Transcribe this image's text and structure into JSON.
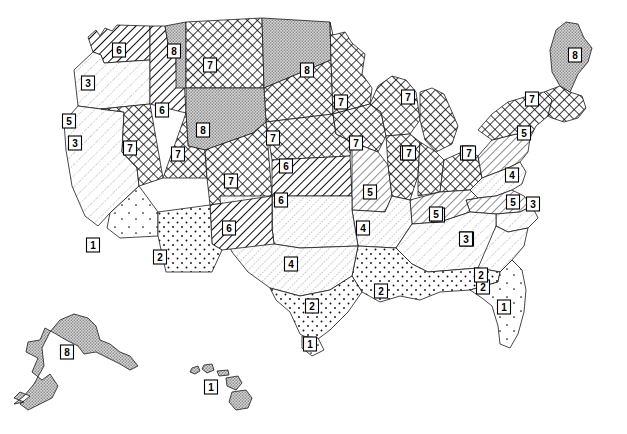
{
  "map": {
    "title": "United States Hardiness Zone Map",
    "projection_note": "Contiguous United States with Alaska and Hawaii insets",
    "width": 627,
    "height": 434,
    "background_color": "#ffffff",
    "outline_color": "#000000",
    "label_box_fill": "#ffffff"
  },
  "legend_patterns": [
    {
      "zone": "1",
      "name": "sparse-dots",
      "fill_color": "#ffffff",
      "description": "very sparse stipple"
    },
    {
      "zone": "2",
      "name": "dots",
      "fill_color": "#ffffff",
      "description": "open dot stipple"
    },
    {
      "zone": "3",
      "name": "fine-diagonal",
      "fill_color": "#ffffff",
      "description": "fine diagonal hatch, low density"
    },
    {
      "zone": "4",
      "name": "diagonal-light",
      "fill_color": "#ffffff",
      "description": "light diagonal hatch"
    },
    {
      "zone": "5",
      "name": "diagonal-medium",
      "fill_color": "#ffffff",
      "description": "medium diagonal hatch"
    },
    {
      "zone": "6",
      "name": "diagonal-bold",
      "fill_color": "#ffffff",
      "description": "bold diagonal hatch"
    },
    {
      "zone": "7",
      "name": "crosshatch",
      "fill_color": "#ffffff",
      "description": "dense cross hatch"
    },
    {
      "zone": "8",
      "name": "stipple-dense",
      "fill_color": "#d8d8d8",
      "description": "dense gray stipple / fine crosshatch"
    }
  ],
  "chart_data": {
    "type": "map",
    "value_field": "zone",
    "zone_range": [
      1,
      8
    ],
    "regions": [
      {
        "id": "washington",
        "name": "Washington",
        "zone": "6",
        "label_x": 119,
        "label_y": 50
      },
      {
        "id": "oregon",
        "name": "Oregon",
        "zone": "3",
        "label_x": 88,
        "label_y": 83
      },
      {
        "id": "n-california",
        "name": "Northern California",
        "zone": "5",
        "label_x": 69,
        "label_y": 121
      },
      {
        "id": "california",
        "name": "California",
        "zone": "3",
        "label_x": 75,
        "label_y": 143
      },
      {
        "id": "s-california",
        "name": "Southern California",
        "zone": "1",
        "label_x": 93,
        "label_y": 245
      },
      {
        "id": "idaho",
        "name": "Idaho",
        "zone": "6",
        "label_x": 162,
        "label_y": 110
      },
      {
        "id": "w-montana",
        "name": "Western Montana",
        "zone": "8",
        "label_x": 174,
        "label_y": 51
      },
      {
        "id": "e-montana",
        "name": "Eastern Montana",
        "zone": "7",
        "label_x": 210,
        "label_y": 65
      },
      {
        "id": "north-dakota",
        "name": "North Dakota",
        "zone": "8",
        "label_x": 307,
        "label_y": 70
      },
      {
        "id": "minnesota",
        "name": "Minnesota",
        "zone": "7",
        "label_x": 341,
        "label_y": 102
      },
      {
        "id": "wyoming",
        "name": "Wyoming",
        "zone": "8",
        "label_x": 203,
        "label_y": 130
      },
      {
        "id": "south-dakota",
        "name": "South Dakota",
        "zone": "7",
        "label_x": 273,
        "label_y": 138
      },
      {
        "id": "nevada",
        "name": "Nevada",
        "zone": "7",
        "label_x": 130,
        "label_y": 148
      },
      {
        "id": "utah",
        "name": "Utah",
        "zone": "7",
        "label_x": 178,
        "label_y": 154
      },
      {
        "id": "colorado",
        "name": "Colorado",
        "zone": "7",
        "label_x": 231,
        "label_y": 181
      },
      {
        "id": "nebraska",
        "name": "Nebraska",
        "zone": "6",
        "label_x": 286,
        "label_y": 166
      },
      {
        "id": "iowa",
        "name": "Iowa",
        "zone": "7",
        "label_x": 356,
        "label_y": 143
      },
      {
        "id": "kansas",
        "name": "Kansas",
        "zone": "6",
        "label_x": 281,
        "label_y": 200
      },
      {
        "id": "missouri",
        "name": "Missouri",
        "zone": "5",
        "label_x": 370,
        "label_y": 192
      },
      {
        "id": "wisconsin",
        "name": "Wisconsin",
        "zone": "7",
        "label_x": 408,
        "label_y": 97
      },
      {
        "id": "michigan",
        "name": "Michigan",
        "zone": "7",
        "label_x": 407,
        "label_y": 153
      },
      {
        "id": "illinois",
        "name": "Illinois",
        "zone": "7",
        "label_x": 409,
        "label_y": 153
      },
      {
        "id": "indiana",
        "name": "Indiana",
        "zone": "7",
        "label_x": 467,
        "label_y": 153
      },
      {
        "id": "arizona",
        "name": "Arizona",
        "zone": "2",
        "label_x": 160,
        "label_y": 257
      },
      {
        "id": "new-mexico",
        "name": "New Mexico",
        "zone": "6",
        "label_x": 229,
        "label_y": 228
      },
      {
        "id": "oklahoma",
        "name": "Oklahoma",
        "zone": "4",
        "label_x": 363,
        "label_y": 228
      },
      {
        "id": "texas",
        "name": "Texas",
        "zone": "4",
        "label_x": 291,
        "label_y": 264
      },
      {
        "id": "s-texas",
        "name": "South Texas",
        "zone": "2",
        "label_x": 312,
        "label_y": 306
      },
      {
        "id": "texas-tip",
        "name": "Texas Gulf Tip",
        "zone": "1",
        "label_x": 310,
        "label_y": 344
      },
      {
        "id": "louisiana",
        "name": "Louisiana",
        "zone": "2",
        "label_x": 381,
        "label_y": 291
      },
      {
        "id": "arkansas",
        "name": "Arkansas",
        "zone": "4",
        "label_x": 363,
        "label_y": 228
      },
      {
        "id": "tennessee",
        "name": "Tennessee",
        "zone": "5",
        "label_x": 438,
        "label_y": 215
      },
      {
        "id": "kentucky",
        "name": "Kentucky",
        "zone": "5",
        "label_x": 436,
        "label_y": 214
      },
      {
        "id": "mississippi",
        "name": "Mississippi",
        "zone": "3",
        "label_x": 467,
        "label_y": 239
      },
      {
        "id": "alabama",
        "name": "Alabama",
        "zone": "3",
        "label_x": 466,
        "label_y": 239
      },
      {
        "id": "gulf-coast",
        "name": "Gulf Coast",
        "zone": "2",
        "label_x": 483,
        "label_y": 287
      },
      {
        "id": "florida",
        "name": "Florida",
        "zone": "1",
        "label_x": 504,
        "label_y": 307
      },
      {
        "id": "georgia",
        "name": "Georgia",
        "zone": "2",
        "label_x": 481,
        "label_y": 275
      },
      {
        "id": "south-carolina",
        "name": "South Carolina",
        "zone": "3",
        "label_x": 533,
        "label_y": 204
      },
      {
        "id": "north-carolina",
        "name": "North Carolina",
        "zone": "5",
        "label_x": 513,
        "label_y": 202
      },
      {
        "id": "virginia",
        "name": "Virginia",
        "zone": "4",
        "label_x": 512,
        "label_y": 175
      },
      {
        "id": "ohio",
        "name": "Ohio",
        "zone": "7",
        "label_x": 469,
        "label_y": 153
      },
      {
        "id": "pennsylvania",
        "name": "Pennsylvania",
        "zone": "5",
        "label_x": 524,
        "label_y": 133
      },
      {
        "id": "new-york",
        "name": "New York",
        "zone": "7",
        "label_x": 532,
        "label_y": 99
      },
      {
        "id": "maine",
        "name": "Maine",
        "zone": "8",
        "label_x": 575,
        "label_y": 55
      },
      {
        "id": "alaska",
        "name": "Alaska",
        "zone": "8",
        "label_x": 67,
        "label_y": 352
      },
      {
        "id": "hawaii",
        "name": "Hawaii",
        "zone": "1",
        "label_x": 211,
        "label_y": 387
      }
    ]
  }
}
